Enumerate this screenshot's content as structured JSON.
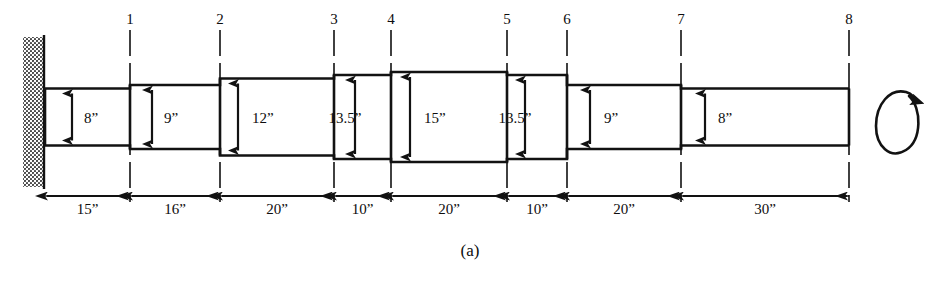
{
  "figure": {
    "caption": "(a)",
    "inch_mark": "”",
    "rotation_indicator": "rotation-arrow"
  },
  "stations": [
    {
      "id": 1,
      "label": "1",
      "x": 130
    },
    {
      "id": 2,
      "label": "2",
      "x": 220
    },
    {
      "id": 3,
      "label": "3",
      "x": 334
    },
    {
      "id": 4,
      "label": "4",
      "x": 391
    },
    {
      "id": 5,
      "label": "5",
      "x": 507
    },
    {
      "id": 6,
      "label": "6",
      "x": 567
    },
    {
      "id": 7,
      "label": "7",
      "x": 681
    },
    {
      "id": 8,
      "label": "8",
      "x": 849
    }
  ],
  "wall": {
    "label": "fixed-support-wall",
    "x": 23,
    "y": 37,
    "width": 20,
    "height": 150
  },
  "sections": [
    {
      "index": 0,
      "diameter_label": "8”",
      "diameter": 8.0,
      "x0": 45,
      "x1": 130,
      "px_height": 57
    },
    {
      "index": 1,
      "diameter_label": "9”",
      "diameter": 9.0,
      "x0": 130,
      "x1": 220,
      "px_height": 64
    },
    {
      "index": 2,
      "diameter_label": "12”",
      "diameter": 12.0,
      "x0": 220,
      "x1": 334,
      "px_height": 77
    },
    {
      "index": 3,
      "diameter_label": "13.5”",
      "diameter": 13.5,
      "x0": 334,
      "x1": 391,
      "px_height": 84
    },
    {
      "index": 4,
      "diameter_label": "15”",
      "diameter": 15.0,
      "x0": 391,
      "x1": 507,
      "px_height": 90
    },
    {
      "index": 5,
      "diameter_label": "13.5”",
      "diameter": 13.5,
      "x0": 507,
      "x1": 567,
      "px_height": 84
    },
    {
      "index": 6,
      "diameter_label": "9”",
      "diameter": 9.0,
      "x0": 567,
      "x1": 681,
      "px_height": 64
    },
    {
      "index": 7,
      "diameter_label": "8”",
      "diameter": 8.0,
      "x0": 681,
      "x1": 849,
      "px_height": 57
    }
  ],
  "lengths": [
    {
      "index": 0,
      "label": "15”",
      "value": 15,
      "from": "wall",
      "to": 1,
      "x0": 45,
      "x1": 130
    },
    {
      "index": 1,
      "label": "16”",
      "value": 16,
      "from": 1,
      "to": 2,
      "x0": 130,
      "x1": 220
    },
    {
      "index": 2,
      "label": "20”",
      "value": 20,
      "from": 2,
      "to": 3,
      "x0": 220,
      "x1": 334
    },
    {
      "index": 3,
      "label": "10”",
      "value": 10,
      "from": 3,
      "to": 4,
      "x0": 334,
      "x1": 391
    },
    {
      "index": 4,
      "label": "20”",
      "value": 20,
      "from": 4,
      "to": 5,
      "x0": 391,
      "x1": 507
    },
    {
      "index": 5,
      "label": "10”",
      "value": 10,
      "from": 5,
      "to": 6,
      "x0": 507,
      "x1": 567
    },
    {
      "index": 6,
      "label": "20”",
      "value": 20,
      "from": 6,
      "to": 7,
      "x0": 567,
      "x1": 681
    },
    {
      "index": 7,
      "label": "30”",
      "value": 30,
      "from": 7,
      "to": 8,
      "x0": 681,
      "x1": 849
    }
  ],
  "colors": {
    "line": "#121212",
    "background": "#ffffff",
    "hatch": "#4a4a4a"
  }
}
